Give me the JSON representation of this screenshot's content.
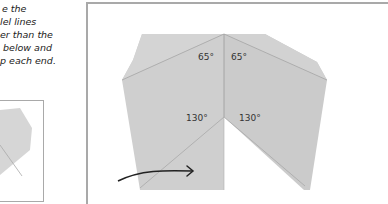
{
  "instructions": {
    "lines": [
      "e the",
      "lel lines",
      "er than the",
      "below and",
      "p each end."
    ]
  },
  "diagram": {
    "angles": {
      "top_left": "65°",
      "top_right": "65°",
      "inner_left": "130°",
      "inner_right": "130°"
    },
    "colors": {
      "paper": "#cfcfcf",
      "paper_light": "#d9d9d9",
      "fold_line": "#9a9a9a",
      "frame": "#a9a9a9",
      "arrow": "#222222"
    }
  }
}
